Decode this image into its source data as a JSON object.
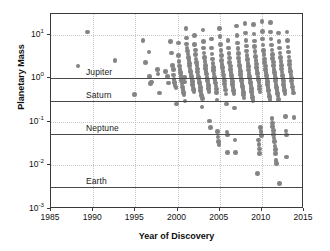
{
  "chart_data": {
    "type": "scatter",
    "title": "",
    "xlabel": "Year of Discovery",
    "ylabel": "Planetary Mass",
    "xlim": [
      1985,
      2015
    ],
    "ylim": [
      0.001,
      30
    ],
    "yscale": "log",
    "grid": true,
    "legend": "none",
    "xticks": [
      1985,
      1990,
      1995,
      2000,
      2005,
      2010,
      2015
    ],
    "xticklabels": [
      "1985",
      "1990",
      "1995",
      "2000",
      "2005",
      "2010",
      "2015"
    ],
    "yticks": [
      10,
      1,
      0.1,
      0.01,
      0.001
    ],
    "yticklabels": [
      "10¹",
      "10⁰",
      "10⁻¹",
      "10⁻²",
      "10⁻³"
    ],
    "ytick_mantissa": [
      "10",
      "10",
      "10",
      "10",
      "10"
    ],
    "ytick_exponent": [
      "1",
      "0",
      "-1",
      "-2",
      "-3"
    ],
    "marker": {
      "shape": "circle",
      "color": "#848484",
      "size": 4.6
    },
    "reference_lines": [
      {
        "label": "Jupiter",
        "value": 1.0,
        "color": "#4a4a4a"
      },
      {
        "label": "Saturn",
        "value": 0.3,
        "color": "#4a4a4a"
      },
      {
        "label": "Neptune",
        "value": 0.054,
        "color": "#4a4a4a"
      },
      {
        "label": "Earth",
        "value": 0.00315,
        "color": "#4a4a4a"
      }
    ],
    "points": [
      [
        1988.2,
        1.9
      ],
      [
        1989.3,
        11.5
      ],
      [
        1992.6,
        2.6
      ],
      [
        1994.9,
        0.42
      ],
      [
        1995.9,
        7.5
      ],
      [
        1996.2,
        2.3
      ],
      [
        1996.6,
        4.0
      ],
      [
        1996.7,
        1.1
      ],
      [
        1996.8,
        0.75
      ],
      [
        1996.9,
        0.82
      ],
      [
        1997.6,
        1.6
      ],
      [
        1997.7,
        1.25
      ],
      [
        1997.9,
        0.46
      ],
      [
        1998.6,
        1.45
      ],
      [
        1998.8,
        1.1
      ],
      [
        1998.9,
        0.78
      ],
      [
        1999.2,
        7.0
      ],
      [
        1999.3,
        3.8
      ],
      [
        1999.4,
        2.0
      ],
      [
        1999.5,
        1.6
      ],
      [
        1999.55,
        1.2
      ],
      [
        1999.6,
        0.95
      ],
      [
        1999.65,
        0.8
      ],
      [
        1999.7,
        0.68
      ],
      [
        1999.8,
        0.62
      ],
      [
        1999.9,
        0.26
      ],
      [
        2000.1,
        6.5
      ],
      [
        2000.15,
        3.3
      ],
      [
        2000.2,
        2.4
      ],
      [
        2000.25,
        1.9
      ],
      [
        2000.3,
        1.6
      ],
      [
        2000.35,
        1.35
      ],
      [
        2000.4,
        1.15
      ],
      [
        2000.45,
        0.98
      ],
      [
        2000.5,
        0.86
      ],
      [
        2000.55,
        0.74
      ],
      [
        2000.6,
        0.63
      ],
      [
        2000.65,
        0.55
      ],
      [
        2000.7,
        0.48
      ],
      [
        2000.75,
        0.43
      ],
      [
        2000.8,
        0.83
      ],
      [
        2000.85,
        1.05
      ],
      [
        2000.9,
        0.3
      ],
      [
        2001.0,
        14.0
      ],
      [
        2001.05,
        8.5
      ],
      [
        2001.1,
        6.2
      ],
      [
        2001.15,
        5.0
      ],
      [
        2001.2,
        4.2
      ],
      [
        2001.25,
        3.6
      ],
      [
        2001.3,
        3.0
      ],
      [
        2001.35,
        2.6
      ],
      [
        2001.4,
        2.2
      ],
      [
        2001.45,
        1.9
      ],
      [
        2001.5,
        1.65
      ],
      [
        2001.55,
        1.45
      ],
      [
        2001.6,
        1.25
      ],
      [
        2001.65,
        1.1
      ],
      [
        2001.7,
        0.95
      ],
      [
        2001.75,
        0.84
      ],
      [
        2001.8,
        0.73
      ],
      [
        2001.85,
        0.64
      ],
      [
        2001.9,
        0.56
      ],
      [
        2001.95,
        0.5
      ],
      [
        2002.0,
        9.5
      ],
      [
        2002.05,
        6.0
      ],
      [
        2002.1,
        4.5
      ],
      [
        2002.15,
        3.5
      ],
      [
        2002.2,
        2.8
      ],
      [
        2002.25,
        2.3
      ],
      [
        2002.3,
        1.95
      ],
      [
        2002.35,
        1.65
      ],
      [
        2002.4,
        1.4
      ],
      [
        2002.45,
        1.2
      ],
      [
        2002.5,
        1.05
      ],
      [
        2002.55,
        0.92
      ],
      [
        2002.6,
        0.8
      ],
      [
        2002.65,
        0.7
      ],
      [
        2002.7,
        0.61
      ],
      [
        2002.75,
        0.53
      ],
      [
        2002.8,
        0.46
      ],
      [
        2002.85,
        0.4
      ],
      [
        2002.9,
        0.22
      ],
      [
        2002.95,
        0.34
      ],
      [
        2003.0,
        13.0
      ],
      [
        2003.05,
        7.0
      ],
      [
        2003.1,
        5.0
      ],
      [
        2003.15,
        3.8
      ],
      [
        2003.2,
        3.0
      ],
      [
        2003.25,
        2.4
      ],
      [
        2003.3,
        2.0
      ],
      [
        2003.35,
        1.7
      ],
      [
        2003.4,
        1.45
      ],
      [
        2003.45,
        1.25
      ],
      [
        2003.5,
        1.05
      ],
      [
        2003.55,
        0.9
      ],
      [
        2003.6,
        0.78
      ],
      [
        2003.65,
        0.68
      ],
      [
        2003.7,
        0.58
      ],
      [
        2003.75,
        0.5
      ],
      [
        2003.8,
        0.105
      ],
      [
        2003.9,
        0.075
      ],
      [
        2004.0,
        8.0
      ],
      [
        2004.05,
        5.0
      ],
      [
        2004.1,
        3.6
      ],
      [
        2004.15,
        2.8
      ],
      [
        2004.2,
        2.2
      ],
      [
        2004.25,
        1.8
      ],
      [
        2004.3,
        1.5
      ],
      [
        2004.35,
        1.25
      ],
      [
        2004.4,
        1.05
      ],
      [
        2004.45,
        0.9
      ],
      [
        2004.5,
        0.78
      ],
      [
        2004.55,
        0.66
      ],
      [
        2004.6,
        0.57
      ],
      [
        2004.65,
        0.48
      ],
      [
        2004.7,
        0.32
      ],
      [
        2004.75,
        0.06
      ],
      [
        2004.8,
        0.045
      ],
      [
        2004.85,
        0.035
      ],
      [
        2004.9,
        0.03
      ],
      [
        2005.0,
        14.0
      ],
      [
        2005.05,
        9.0
      ],
      [
        2005.1,
        6.0
      ],
      [
        2005.15,
        4.3
      ],
      [
        2005.2,
        3.3
      ],
      [
        2005.25,
        2.6
      ],
      [
        2005.3,
        2.1
      ],
      [
        2005.35,
        1.75
      ],
      [
        2005.4,
        1.45
      ],
      [
        2005.45,
        1.2
      ],
      [
        2005.5,
        1.0
      ],
      [
        2005.55,
        0.86
      ],
      [
        2005.6,
        0.74
      ],
      [
        2005.65,
        0.63
      ],
      [
        2005.7,
        0.54
      ],
      [
        2005.75,
        0.44
      ],
      [
        2005.8,
        0.26
      ],
      [
        2005.85,
        0.058
      ],
      [
        2005.9,
        0.05
      ],
      [
        2005.95,
        0.02
      ],
      [
        2006.0,
        7.5
      ],
      [
        2006.05,
        5.0
      ],
      [
        2006.1,
        3.7
      ],
      [
        2006.15,
        2.9
      ],
      [
        2006.2,
        2.3
      ],
      [
        2006.25,
        1.9
      ],
      [
        2006.3,
        1.6
      ],
      [
        2006.35,
        1.35
      ],
      [
        2006.4,
        1.15
      ],
      [
        2006.45,
        0.98
      ],
      [
        2006.5,
        0.84
      ],
      [
        2006.55,
        0.72
      ],
      [
        2006.6,
        0.62
      ],
      [
        2006.65,
        0.53
      ],
      [
        2006.7,
        0.45
      ],
      [
        2006.75,
        0.21
      ],
      [
        2006.8,
        0.038
      ],
      [
        2006.9,
        0.02
      ],
      [
        2007.0,
        16.0
      ],
      [
        2007.05,
        9.5
      ],
      [
        2007.1,
        6.5
      ],
      [
        2007.15,
        4.8
      ],
      [
        2007.2,
        3.7
      ],
      [
        2007.25,
        2.9
      ],
      [
        2007.3,
        2.4
      ],
      [
        2007.35,
        2.0
      ],
      [
        2007.4,
        1.7
      ],
      [
        2007.45,
        1.45
      ],
      [
        2007.5,
        1.22
      ],
      [
        2007.55,
        1.04
      ],
      [
        2007.6,
        0.89
      ],
      [
        2007.65,
        0.76
      ],
      [
        2007.7,
        0.65
      ],
      [
        2007.75,
        0.56
      ],
      [
        2007.8,
        0.48
      ],
      [
        2007.85,
        0.41
      ],
      [
        2007.9,
        0.35
      ],
      [
        2008.0,
        18.0
      ],
      [
        2008.05,
        11.0
      ],
      [
        2008.1,
        7.5
      ],
      [
        2008.15,
        5.5
      ],
      [
        2008.2,
        4.2
      ],
      [
        2008.25,
        3.3
      ],
      [
        2008.3,
        2.7
      ],
      [
        2008.35,
        2.2
      ],
      [
        2008.4,
        1.85
      ],
      [
        2008.45,
        1.55
      ],
      [
        2008.5,
        1.3
      ],
      [
        2008.55,
        1.1
      ],
      [
        2008.6,
        0.95
      ],
      [
        2008.65,
        0.81
      ],
      [
        2008.7,
        0.69
      ],
      [
        2008.75,
        0.59
      ],
      [
        2008.8,
        0.5
      ],
      [
        2008.85,
        0.43
      ],
      [
        2008.9,
        0.36
      ],
      [
        2008.95,
        0.31
      ],
      [
        2009.0,
        17.0
      ],
      [
        2009.05,
        10.5
      ],
      [
        2009.1,
        7.2
      ],
      [
        2009.15,
        5.3
      ],
      [
        2009.2,
        4.1
      ],
      [
        2009.25,
        3.2
      ],
      [
        2009.3,
        2.6
      ],
      [
        2009.35,
        2.15
      ],
      [
        2009.4,
        1.8
      ],
      [
        2009.45,
        1.5
      ],
      [
        2009.5,
        1.28
      ],
      [
        2009.55,
        1.08
      ],
      [
        2009.6,
        0.92
      ],
      [
        2009.65,
        0.79
      ],
      [
        2009.7,
        0.67
      ],
      [
        2009.75,
        0.57
      ],
      [
        2009.8,
        0.49
      ],
      [
        2009.85,
        0.075
      ],
      [
        2009.9,
        0.06
      ],
      [
        2009.95,
        0.048
      ],
      [
        2009.6,
        0.038
      ],
      [
        2009.65,
        0.03
      ],
      [
        2009.7,
        0.024
      ],
      [
        2009.75,
        0.019
      ],
      [
        2009.5,
        0.0065
      ],
      [
        2010.0,
        20.0
      ],
      [
        2010.05,
        12.0
      ],
      [
        2010.1,
        8.0
      ],
      [
        2010.15,
        5.8
      ],
      [
        2010.2,
        4.4
      ],
      [
        2010.25,
        3.5
      ],
      [
        2010.3,
        2.8
      ],
      [
        2010.35,
        2.3
      ],
      [
        2010.4,
        1.9
      ],
      [
        2010.45,
        1.6
      ],
      [
        2010.5,
        1.35
      ],
      [
        2010.55,
        1.15
      ],
      [
        2010.6,
        0.98
      ],
      [
        2010.65,
        0.84
      ],
      [
        2010.7,
        0.72
      ],
      [
        2010.75,
        0.61
      ],
      [
        2010.8,
        0.52
      ],
      [
        2010.85,
        0.44
      ],
      [
        2010.9,
        0.38
      ],
      [
        2010.95,
        0.33
      ],
      [
        2011.0,
        19.0
      ],
      [
        2011.05,
        11.5
      ],
      [
        2011.1,
        8.0
      ],
      [
        2011.15,
        5.8
      ],
      [
        2011.2,
        4.5
      ],
      [
        2011.25,
        3.5
      ],
      [
        2011.3,
        2.85
      ],
      [
        2011.35,
        2.35
      ],
      [
        2011.4,
        1.95
      ],
      [
        2011.45,
        1.62
      ],
      [
        2011.5,
        1.38
      ],
      [
        2011.55,
        1.17
      ],
      [
        2011.6,
        1.0
      ],
      [
        2011.65,
        0.86
      ],
      [
        2011.7,
        0.73
      ],
      [
        2011.75,
        0.62
      ],
      [
        2011.8,
        0.53
      ],
      [
        2011.85,
        0.45
      ],
      [
        2011.9,
        0.39
      ],
      [
        2011.95,
        0.33
      ],
      [
        2011.2,
        0.12
      ],
      [
        2011.25,
        0.095
      ],
      [
        2011.3,
        0.078
      ],
      [
        2011.35,
        0.064
      ],
      [
        2011.4,
        0.052
      ],
      [
        2011.45,
        0.043
      ],
      [
        2011.5,
        0.035
      ],
      [
        2011.55,
        0.028
      ],
      [
        2011.6,
        0.023
      ],
      [
        2011.65,
        0.019
      ],
      [
        2011.7,
        0.013
      ],
      [
        2011.75,
        0.011
      ],
      [
        2012.0,
        11.0
      ],
      [
        2012.05,
        7.0
      ],
      [
        2012.1,
        5.0
      ],
      [
        2012.15,
        3.8
      ],
      [
        2012.2,
        3.0
      ],
      [
        2012.25,
        2.4
      ],
      [
        2012.3,
        2.0
      ],
      [
        2012.35,
        1.65
      ],
      [
        2012.4,
        1.4
      ],
      [
        2012.45,
        1.18
      ],
      [
        2012.5,
        1.0
      ],
      [
        2012.55,
        0.86
      ],
      [
        2012.6,
        0.73
      ],
      [
        2012.65,
        0.62
      ],
      [
        2012.7,
        0.53
      ],
      [
        2012.75,
        0.45
      ],
      [
        2012.8,
        0.135
      ],
      [
        2012.85,
        0.062
      ],
      [
        2012.9,
        0.05
      ],
      [
        2012.95,
        0.0155
      ],
      [
        2012.1,
        0.0038
      ],
      [
        2013.0,
        11.5
      ],
      [
        2013.05,
        7.5
      ],
      [
        2013.1,
        5.2
      ],
      [
        2013.15,
        4.0
      ],
      [
        2013.2,
        3.1
      ],
      [
        2013.25,
        2.5
      ],
      [
        2013.3,
        2.05
      ],
      [
        2013.35,
        1.7
      ],
      [
        2013.4,
        1.42
      ],
      [
        2013.45,
        1.2
      ],
      [
        2013.5,
        1.02
      ],
      [
        2013.55,
        0.87
      ],
      [
        2013.6,
        0.74
      ],
      [
        2013.65,
        0.63
      ],
      [
        2013.7,
        0.54
      ],
      [
        2013.75,
        0.46
      ],
      [
        2013.8,
        0.128
      ]
    ]
  }
}
